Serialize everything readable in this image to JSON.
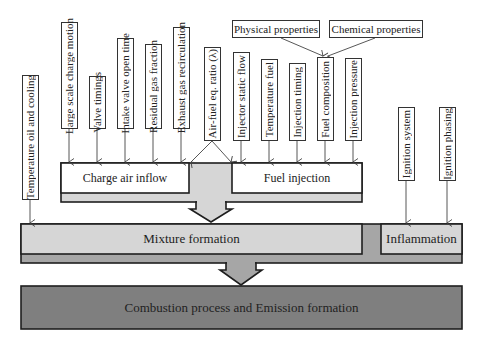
{
  "colors": {
    "stroke": "#1e1e1e",
    "white_box": "#ffffff",
    "light_gray": "#d6d6d6",
    "mid_gray": "#a6a6a6",
    "dark_gray": "#7f7f7f"
  },
  "top_properties": {
    "physical": "Physical properties",
    "chemical": "Chemical properties"
  },
  "left_factor": "Temperature oil and cooling",
  "charge_air_factors": [
    "Large scale charge motion",
    "Valve timings",
    "Intake valve open time",
    "Residual gas fraction",
    "Exhaust gas recirculation"
  ],
  "shared_factor": "Air-fuel eq. ratio (λ)",
  "fuel_factors": [
    "Injector static flow",
    "Temperature fuel",
    "Injection timing",
    "Fuel composition",
    "Injection pressure"
  ],
  "ignition_factors": [
    "Ignition system",
    "Ignition phasing"
  ],
  "stages": {
    "charge_air": "Charge air inflow",
    "fuel_injection": "Fuel injection",
    "mixture": "Mixture formation",
    "inflammation": "Inflammation",
    "combustion": "Combustion process and Emission formation"
  }
}
